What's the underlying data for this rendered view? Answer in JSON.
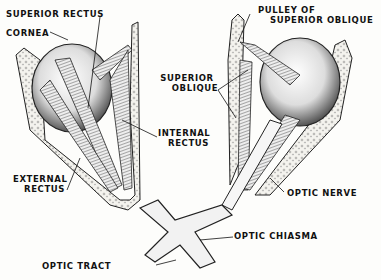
{
  "diagram": {
    "labels": {
      "superior_rectus": "SUPERIOR RECTUS",
      "cornea": "CORNEA",
      "pulley_line1": "PULLEY OF",
      "pulley_line2": "SUPERIOR OBLIQUE",
      "superior_oblique_line1": "SUPERIOR",
      "superior_oblique_line2": "OBLIQUE",
      "internal_rectus_line1": "INTERNAL",
      "internal_rectus_line2": "RECTUS",
      "external_rectus_line1": "EXTERNAL",
      "external_rectus_line2": "RECTUS",
      "optic_nerve": "OPTIC NERVE",
      "optic_chiasma": "OPTIC CHIASMA",
      "optic_tract": "OPTIC TRACT"
    },
    "colors": {
      "ink": "#111111",
      "paper": "#fdfdfb",
      "bone": "#e8e6df"
    }
  }
}
